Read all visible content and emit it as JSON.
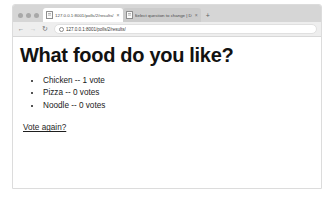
{
  "browser": {
    "window_controls": [
      "close",
      "minimize",
      "maximize"
    ],
    "tabs": [
      {
        "title": "127.0.0.1:8001/polls/2/results/",
        "favicon": "document-icon",
        "active": true,
        "close_label": "×"
      },
      {
        "title": "Select question to change | D",
        "favicon": "document-icon",
        "active": false,
        "close_label": "×"
      }
    ],
    "new_tab_label": "+",
    "toolbar": {
      "back_label": "←",
      "forward_label": "→",
      "reload_label": "↻",
      "site_info_icon": "info-icon",
      "url": "127.0.0.1:8001/polls/2/results/"
    }
  },
  "page": {
    "title": "What food do you like?",
    "results": [
      "Chicken -- 1 vote",
      "Pizza -- 0 votes",
      "Noodle -- 0 votes"
    ],
    "vote_again_label": "Vote again?"
  },
  "colors": {
    "tab_strip": "#d6d6d6",
    "toolbar": "#eeeeee",
    "page_background": "#ffffff",
    "text": "#1a1a1a",
    "window_border": "#dcdcdc"
  }
}
